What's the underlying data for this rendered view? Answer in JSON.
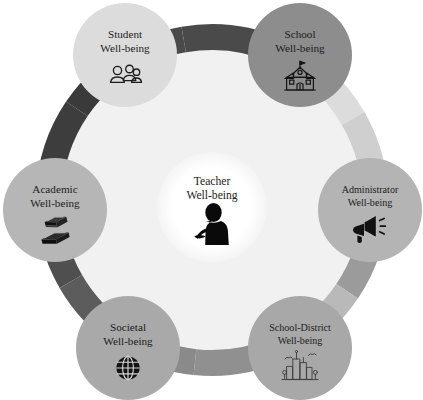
{
  "diagram": {
    "type": "hub-and-spoke-circular",
    "center": {
      "label_line1": "Teacher",
      "label_line2": "Well-being",
      "icon": "teacher-silhouette-icon",
      "fill": "#ffffff",
      "text_color": "#1c1c1c"
    },
    "background_disc_fill": "#f1f1f1",
    "nodes": [
      {
        "id": "student",
        "label_line1": "Student",
        "label_line2": "Well-being",
        "icon": "people-group-icon",
        "fill": "#dcdcdc",
        "angle_deg": -90,
        "cx": 125,
        "cy": 55,
        "r": 52
      },
      {
        "id": "school",
        "label_line1": "School",
        "label_line2": "Well-being",
        "icon": "school-building-icon",
        "fill": "#8d8d8d",
        "angle_deg": -30,
        "cx": 300,
        "cy": 55,
        "r": 52
      },
      {
        "id": "administrator",
        "label_line1": "Administrator",
        "label_line2": "Well-being",
        "icon": "megaphone-icon",
        "fill": "#b4b4b4",
        "angle_deg": 30,
        "cx": 370,
        "cy": 210,
        "r": 52
      },
      {
        "id": "school-district",
        "label_line1": "School-District",
        "label_line2": "Well-being",
        "icon": "city-skyline-icon",
        "fill": "#a8a8a8",
        "angle_deg": 90,
        "cx": 300,
        "cy": 348,
        "r": 52
      },
      {
        "id": "societal",
        "label_line1": "Societal",
        "label_line2": "Well-being",
        "icon": "globe-icon",
        "fill": "#a9a9a9",
        "angle_deg": 150,
        "cx": 128,
        "cy": 348,
        "r": 52
      },
      {
        "id": "academic",
        "label_line1": "Academic",
        "label_line2": "Well-being",
        "icon": "stacked-books-icon",
        "fill": "#b6b6b6",
        "angle_deg": 210,
        "cx": 55,
        "cy": 210,
        "r": 52
      }
    ],
    "ring": {
      "outer_radius": 176,
      "inner_radius": 150,
      "center_x": 212,
      "center_y": 200,
      "segments": [
        {
          "id": "seg-top",
          "from_deg": -100,
          "to_deg": -66,
          "fill": "#4a4a4a"
        },
        {
          "id": "seg-top-right-1",
          "from_deg": -66,
          "to_deg": -30,
          "fill": "#dcdcdc"
        },
        {
          "id": "seg-top-right-2",
          "from_deg": -30,
          "to_deg": 2,
          "fill": "#cfcfcf"
        },
        {
          "id": "seg-right-1",
          "from_deg": 2,
          "to_deg": 34,
          "fill": "#9b9b9b"
        },
        {
          "id": "seg-right-2",
          "from_deg": 34,
          "to_deg": 66,
          "fill": "#b9b9b9"
        },
        {
          "id": "seg-bottom-right-1",
          "from_deg": 66,
          "to_deg": 96,
          "fill": "#909090"
        },
        {
          "id": "seg-bottom-1",
          "from_deg": 96,
          "to_deg": 124,
          "fill": "#8a8a8a"
        },
        {
          "id": "seg-bottom-2",
          "from_deg": 124,
          "to_deg": 150,
          "fill": "#5c5c5c"
        },
        {
          "id": "seg-bottom-left-1",
          "from_deg": 150,
          "to_deg": 182,
          "fill": "#4f4f4f"
        },
        {
          "id": "seg-left-1",
          "from_deg": 182,
          "to_deg": 214,
          "fill": "#3d3d3d"
        },
        {
          "id": "seg-left-2",
          "from_deg": 214,
          "to_deg": 246,
          "fill": "#3a3a3a"
        },
        {
          "id": "seg-top-left-1",
          "from_deg": 246,
          "to_deg": 260,
          "fill": "#4a4a4a"
        }
      ]
    }
  }
}
